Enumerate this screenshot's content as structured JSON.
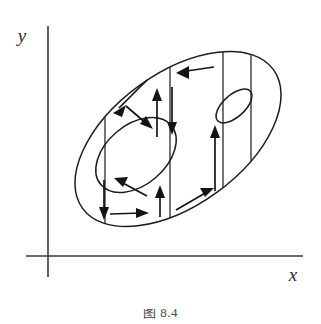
{
  "figure": {
    "background_color": "#ffffff",
    "ink_color": "#1d1d1d",
    "axis_color": "#3a3a3a"
  },
  "axes": {
    "x_label": "x",
    "y_label": "y",
    "origin_x": 48,
    "origin_y": 256,
    "y_axis_top": 26,
    "y_axis_bottom": 277,
    "x_axis_left": 26,
    "x_axis_right": 303
  },
  "region": {
    "name": "outer-ellipse",
    "center_x": 178,
    "center_y": 139,
    "radius_x": 118,
    "radius_y": 66,
    "rotation_deg": -36
  },
  "holes": [
    {
      "name": "large-hole",
      "center_x": 136,
      "center_y": 155,
      "radius_x": 46,
      "radius_y": 30,
      "rotation_deg": -40
    },
    {
      "name": "small-hole",
      "center_x": 234,
      "center_y": 106,
      "radius_x": 22,
      "radius_y": 11,
      "rotation_deg": -42
    }
  ],
  "chords": [
    {
      "name": "chord-1",
      "x": 105,
      "y_top": 131,
      "y_bottom": 228
    },
    {
      "name": "chord-2",
      "x": 170,
      "y_top": 62,
      "y_bottom": 226
    },
    {
      "name": "chord-3",
      "x": 223,
      "y_top": 46,
      "y_bottom": 194
    },
    {
      "name": "chord-4",
      "x": 251,
      "y_top": 53,
      "y_bottom": 166
    }
  ],
  "arrows": [
    {
      "name": "arrow-top-edge-left",
      "direction": "left",
      "x1": 212,
      "y1": 68,
      "x2": 176,
      "y2": 73
    },
    {
      "name": "arrow-upper-left-down",
      "direction": "down-left",
      "x1": 145,
      "y1": 82,
      "x2": 114,
      "y2": 112
    },
    {
      "name": "arrow-upper-mid-down",
      "direction": "down-right",
      "x1": 128,
      "y1": 107,
      "x2": 152,
      "y2": 128
    },
    {
      "name": "arrow-vert-up-inner",
      "direction": "up",
      "x1": 157,
      "y1": 136,
      "x2": 157,
      "y2": 90
    },
    {
      "name": "arrow-vert-down-inner",
      "direction": "down",
      "x1": 172,
      "y1": 88,
      "x2": 172,
      "y2": 134
    },
    {
      "name": "arrow-hole-left-up",
      "direction": "up-left",
      "x1": 145,
      "y1": 195,
      "x2": 115,
      "y2": 179
    },
    {
      "name": "arrow-bottom-right",
      "direction": "right",
      "x1": 110,
      "y1": 213,
      "x2": 148,
      "y2": 213
    },
    {
      "name": "arrow-left-down",
      "direction": "down",
      "x1": 104,
      "y1": 180,
      "x2": 104,
      "y2": 219
    },
    {
      "name": "arrow-short-up-mid",
      "direction": "up",
      "x1": 160,
      "y1": 216,
      "x2": 160,
      "y2": 186
    },
    {
      "name": "arrow-bottom-edge-up-right",
      "direction": "up-right",
      "x1": 176,
      "y1": 209,
      "x2": 213,
      "y2": 188
    },
    {
      "name": "arrow-right-vert-up",
      "direction": "up",
      "x1": 215,
      "y1": 190,
      "x2": 215,
      "y2": 126
    }
  ],
  "caption": {
    "text": "图 8.4",
    "clipped": true
  }
}
